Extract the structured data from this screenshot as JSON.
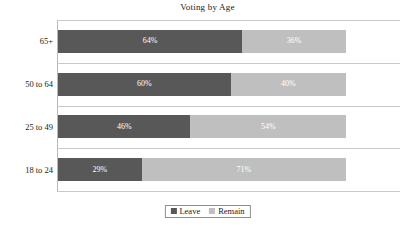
{
  "chart_data": {
    "type": "bar",
    "orientation": "horizontal",
    "stacked": true,
    "normalized": true,
    "title": "Voting by Age",
    "xlabel": "",
    "ylabel": "",
    "xlim": [
      0,
      100
    ],
    "grid": true,
    "legend_position": "bottom",
    "categories": [
      "65+",
      "50 to 64",
      "25 to 49",
      "18 to 24"
    ],
    "series": [
      {
        "name": "Leave",
        "color": "#585858",
        "values": [
          64,
          60,
          46,
          29
        ],
        "labels": [
          "64%",
          "60%",
          "46%",
          "29%"
        ]
      },
      {
        "name": "Remain",
        "color": "#bfbfbf",
        "values": [
          36,
          40,
          54,
          71
        ],
        "labels": [
          "36%",
          "40%",
          "54%",
          "71%"
        ]
      }
    ]
  },
  "legend": {
    "items": [
      {
        "label": "Leave",
        "color": "#585858"
      },
      {
        "label": "Remain",
        "color": "#bfbfbf"
      }
    ]
  },
  "colors": {
    "leave": "#585858",
    "remain": "#bfbfbf",
    "gridline": "#c9c9c9",
    "text": "#1a1a1a",
    "background": "#ffffff"
  }
}
